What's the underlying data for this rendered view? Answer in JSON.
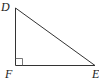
{
  "diagram": {
    "type": "right-triangle",
    "vertices": [
      {
        "name": "D",
        "label": "D"
      },
      {
        "name": "F",
        "label": "F"
      },
      {
        "name": "E",
        "label": "E"
      }
    ],
    "right_angle_at": "F",
    "segments": [
      "DF",
      "FE",
      "DE"
    ],
    "stroke_color": "#333333"
  }
}
